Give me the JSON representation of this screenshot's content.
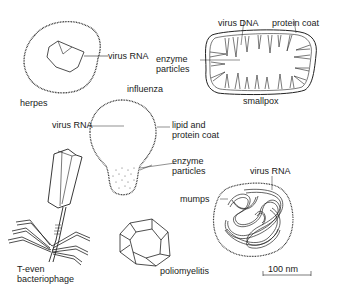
{
  "figure": {
    "viruses": {
      "herpes": {
        "name": "herpes",
        "labels": {
          "rna": "virus RNA"
        }
      },
      "smallpox": {
        "name": "smallpox",
        "labels": {
          "dna": "virus DNA",
          "coat": "protein coat",
          "enzyme_1": "enzyme",
          "enzyme_2": "particles"
        }
      },
      "influenza": {
        "name": "influenza",
        "labels": {
          "rna": "virus RNA",
          "coat_1": "lipid and",
          "coat_2": "protein coat",
          "enzyme_1": "enzyme",
          "enzyme_2": "particles"
        }
      },
      "bacteriophage": {
        "name_1": "T-even",
        "name_2": "bacteriophage"
      },
      "poliomyelitis": {
        "name": "poliomyelitis"
      },
      "mumps": {
        "name": "mumps",
        "labels": {
          "rna": "virus RNA"
        }
      }
    },
    "scale_bar": {
      "label": "100 nm"
    }
  }
}
